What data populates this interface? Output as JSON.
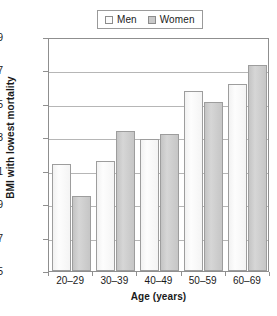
{
  "chart_data": {
    "type": "bar",
    "title": "",
    "xlabel": "Age (years)",
    "ylabel": "BMI with lowest mortality",
    "categories": [
      "20–29",
      "30–39",
      "40–49",
      "50–59",
      "60–69"
    ],
    "series": [
      {
        "name": "Men",
        "values": [
          21.4,
          21.6,
          22.9,
          25.8,
          26.2
        ],
        "color": "#fbfbfb"
      },
      {
        "name": "Women",
        "values": [
          19.5,
          23.4,
          23.2,
          25.1,
          27.3
        ],
        "color": "#c9c9c9"
      }
    ],
    "ylim": [
      15,
      29
    ],
    "yticks": [
      "15",
      "17",
      "19",
      "21",
      "23",
      "25",
      "27",
      "29"
    ],
    "ytick_values": [
      15,
      17,
      19,
      21,
      23,
      25,
      27,
      29
    ],
    "grid": true,
    "grid_axis": "y",
    "legend_position": "top-center",
    "legend_entries": [
      "Men",
      "Women"
    ]
  },
  "legend": {
    "men": "Men",
    "women": "Women"
  },
  "axes": {
    "y_title": "BMI with lowest mortality",
    "x_title": "Age (years)"
  }
}
